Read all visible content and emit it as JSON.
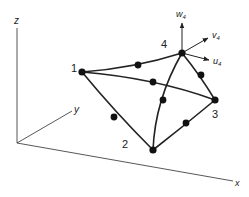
{
  "diagram": {
    "axes": {
      "x_label": "x",
      "y_label": "y",
      "z_label": "z"
    },
    "nodes": [
      {
        "id": "1",
        "label": "1"
      },
      {
        "id": "2",
        "label": "2"
      },
      {
        "id": "3",
        "label": "3"
      },
      {
        "id": "4",
        "label": "4"
      }
    ],
    "displacements": {
      "u": {
        "base": "u",
        "sub": "4"
      },
      "v": {
        "base": "v",
        "sub": "4"
      },
      "w": {
        "base": "w",
        "sub": "4"
      }
    },
    "colors": {
      "line": "#222222",
      "node": "#111111"
    }
  }
}
